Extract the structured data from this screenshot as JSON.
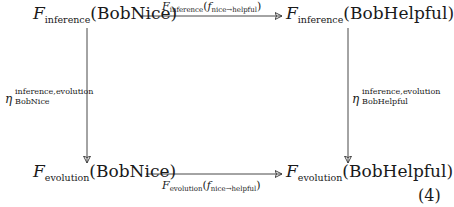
{
  "diagram": {
    "type": "commutative-diagram",
    "nodes": {
      "top_left": {
        "functor": "F",
        "functor_sub": "inference",
        "object": "(BobNice)"
      },
      "top_right": {
        "functor": "F",
        "functor_sub": "inference",
        "object": "(BobHelpful)"
      },
      "bottom_left": {
        "functor": "F",
        "functor_sub": "evolution",
        "object": "(BobNice)"
      },
      "bottom_right": {
        "functor": "F",
        "functor_sub": "evolution",
        "object": "(BobHelpful)"
      }
    },
    "arrows": {
      "top": {
        "functor": "F",
        "functor_sub": "inference",
        "open": "(",
        "morphism": "f",
        "morphism_sub": "nice→helpful",
        "close": ")"
      },
      "bottom": {
        "functor": "F",
        "functor_sub": "evolution",
        "open": "(",
        "morphism": "f",
        "morphism_sub": "nice→helpful",
        "close": ")"
      },
      "left": {
        "symbol": "η",
        "superscript": "inference,evolution",
        "subscript": "BobNice"
      },
      "right": {
        "symbol": "η",
        "superscript": "inference,evolution",
        "subscript": "BobHelpful"
      }
    },
    "equation_number": "(4)",
    "line_color": "#333333"
  }
}
